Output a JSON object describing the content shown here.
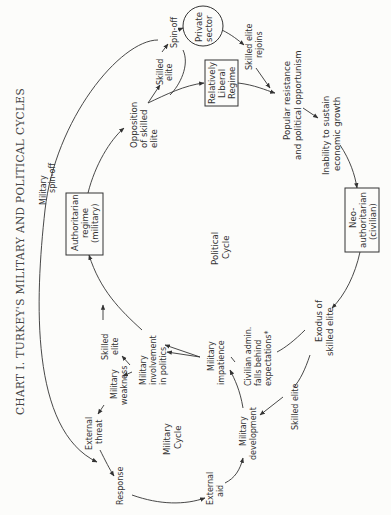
{
  "title": "CHART I. TURKEY'S MILITARY AND POLITICAL CYCLES",
  "cycles": {
    "political": [
      "Political",
      "Cycle"
    ],
    "military": [
      "Military",
      "Cycle"
    ]
  },
  "nodes": {
    "private_sector": [
      "Private",
      "sector"
    ],
    "relatively_liberal_regime": [
      "Relatively",
      "Liberal",
      "Regime"
    ],
    "authoritarian_regime": [
      "Authoritarian",
      "regime",
      "(military)"
    ],
    "neo_authoritarian": [
      "Neo-",
      "authoritarian",
      "(civilian)"
    ]
  },
  "labels": {
    "military_spin_off": [
      "Military",
      "spin-off"
    ],
    "spin_off": "Spin-off",
    "skilled_elite_top": [
      "Skilled",
      "elite"
    ],
    "opposition": [
      "Opposition",
      "of skilled",
      "elite"
    ],
    "skilled_elite_rejoins": [
      "Skilled elite",
      "rejoins"
    ],
    "popular_resistance": [
      "Popular resistance",
      "and political opportunism"
    ],
    "inability": [
      "Inability to sustain",
      "economic growth"
    ],
    "exodus": [
      "Exodus of",
      "skilled elite"
    ],
    "civilian_admin": [
      "Civilian admin.",
      "falls behind",
      "expectations*"
    ],
    "skilled_elite_bottom": "Skilled elite",
    "military_impatience": [
      "Military",
      "impatience"
    ],
    "military_involvement": [
      "Military",
      "involvement",
      "in politics"
    ],
    "skilled_elite_left": [
      "Skilled",
      "elite"
    ],
    "military_weakness": [
      "Military",
      "weakness"
    ],
    "external_threat": [
      "External",
      "threat"
    ],
    "response": "Response",
    "external_aid": [
      "External",
      "aid"
    ],
    "military_development": [
      "Military",
      "development"
    ]
  }
}
